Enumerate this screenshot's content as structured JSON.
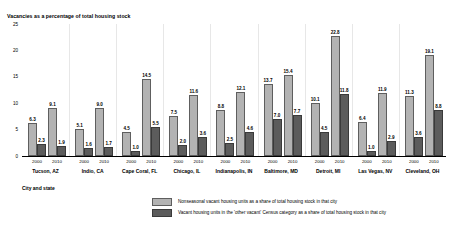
{
  "chart_data": {
    "type": "bar",
    "title": "Vacancies as a percentage of total housing stock",
    "xlabel": "City and state",
    "ylabel": "",
    "ylim": [
      0,
      25
    ],
    "yticks": [
      "0",
      "5",
      "10",
      "15",
      "20",
      "25"
    ],
    "grid": false,
    "legend_position": "bottom",
    "categories": [
      "Tucson, AZ",
      "Indio, CA",
      "Cape Coral, FL",
      "Chicago, IL",
      "Indianapolis, IN",
      "Baltimore, MD",
      "Detroit, MI",
      "Las Vegas, NV",
      "Cleveland, OH"
    ],
    "subcategories": [
      "2000",
      "2010"
    ],
    "series": [
      {
        "name": "Nonseasonal vacant housing units as a share of total housing stock in that city",
        "color": "#b3b3b3",
        "values_2000": [
          6.3,
          5.1,
          4.5,
          7.5,
          8.8,
          13.7,
          10.1,
          6.4,
          11.3
        ],
        "values_2010": [
          9.1,
          9.0,
          14.5,
          11.6,
          12.1,
          15.4,
          22.8,
          11.9,
          19.1
        ]
      },
      {
        "name": "Vacant housing units in the 'other vacant' Census category as a share of total housing stock in that city",
        "color": "#5c5c5c",
        "values_2000": [
          2.3,
          1.6,
          1.0,
          2.0,
          2.5,
          7.0,
          4.5,
          1.0,
          3.6
        ],
        "values_2010": [
          1.9,
          1.7,
          5.5,
          3.6,
          4.6,
          7.7,
          11.8,
          2.9,
          8.8
        ]
      }
    ]
  },
  "legend": {
    "items": [
      {
        "swatch": "light",
        "label": "Nonseasonal vacant housing units as a share of total housing stock in that city"
      },
      {
        "swatch": "dark",
        "label": "Vacant housing units in the 'other vacant' Census category as a share of total housing stock in that city"
      }
    ]
  }
}
